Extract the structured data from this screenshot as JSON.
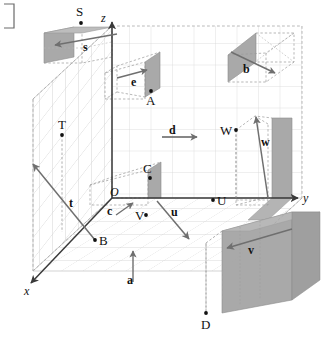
{
  "figure": {
    "corner_mark": "]",
    "colors": {
      "background": "#ffffff",
      "grid_line": "#d2d2d2",
      "grid_line_strong": "#bdbdbd",
      "shade_fill": "#a9a9a9",
      "shade_fill_light": "#bfbfbf",
      "axis": "#3a3a3a",
      "vector": "#787878",
      "dashed": "#9a9a9a",
      "label": "#111111"
    },
    "axes": [
      {
        "name": "x-axis",
        "label": "x",
        "x": 24,
        "y": 291,
        "direction": "down-left"
      },
      {
        "name": "y-axis",
        "label": "y",
        "x": 303,
        "y": 198,
        "direction": "right"
      },
      {
        "name": "z-axis",
        "label": "z",
        "x": 104,
        "y": 18,
        "direction": "up"
      }
    ],
    "origin": {
      "label": "O",
      "x": 110,
      "y": 192
    },
    "points": [
      {
        "label": "S",
        "lx": 76,
        "ly": 11,
        "px": 81,
        "py": 23
      },
      {
        "label": "A",
        "lx": 146,
        "ly": 100,
        "px": 151,
        "py": 91
      },
      {
        "label": "T",
        "lx": 60,
        "ly": 123,
        "px": 62,
        "py": 135
      },
      {
        "label": "C",
        "lx": 144,
        "ly": 167,
        "px": 150,
        "py": 178
      },
      {
        "label": "B",
        "lx": 100,
        "ly": 241,
        "px": 95,
        "py": 240
      },
      {
        "label": "V",
        "lx": 137,
        "ly": 215,
        "px": 146,
        "py": 215
      },
      {
        "label": "U",
        "lx": 219,
        "ly": 200,
        "px": 213,
        "py": 200
      },
      {
        "label": "W",
        "lx": 222,
        "ly": 129,
        "px": 236,
        "py": 130
      },
      {
        "label": "D",
        "lx": 203,
        "ly": 324,
        "px": 206,
        "py": 313
      }
    ],
    "vectors": [
      {
        "name": "s",
        "label": "s",
        "lx": 85,
        "ly": 46,
        "x1": 117,
        "y1": 34,
        "x2": 53,
        "y2": 45
      },
      {
        "name": "b",
        "label": "b",
        "lx": 245,
        "ly": 69,
        "x1": 235,
        "y1": 52,
        "x2": 277,
        "y2": 73
      },
      {
        "name": "e",
        "label": "e",
        "lx": 133,
        "ly": 82,
        "x1": 117,
        "y1": 77,
        "x2": 148,
        "y2": 70
      },
      {
        "name": "d",
        "label": "d",
        "lx": 171,
        "ly": 130,
        "x1": 162,
        "y1": 136,
        "x2": 198,
        "y2": 136
      },
      {
        "name": "w",
        "label": "w",
        "lx": 263,
        "ly": 142,
        "x1": 268,
        "y1": 197,
        "x2": 255,
        "y2": 116
      },
      {
        "name": "t",
        "label": "t",
        "lx": 71,
        "ly": 203,
        "x1": 95,
        "y1": 240,
        "x2": 31,
        "y2": 163
      },
      {
        "name": "c",
        "label": "c",
        "lx": 110,
        "ly": 211,
        "x1": 117,
        "y1": 214,
        "x2": 133,
        "y2": 203
      },
      {
        "name": "u",
        "label": "u",
        "lx": 173,
        "ly": 212,
        "x1": 157,
        "y1": 201,
        "x2": 190,
        "y2": 240
      },
      {
        "name": "v",
        "label": "v",
        "lx": 250,
        "ly": 250,
        "x1": 291,
        "y1": 229,
        "x2": 226,
        "y2": 248
      },
      {
        "name": "a",
        "label": "a",
        "lx": 129,
        "ly": 280,
        "x1": 133,
        "y1": 281,
        "x2": 133,
        "y2": 250
      }
    ],
    "shaded_planes": [
      {
        "name": "plane-s",
        "desc": "shaded strip near S"
      },
      {
        "name": "plane-b",
        "desc": "shaded parallelogram near b"
      },
      {
        "name": "plane-e-A",
        "desc": "shaded rectangle containing A"
      },
      {
        "name": "plane-C",
        "desc": "shaded rectangle containing C"
      },
      {
        "name": "plane-u",
        "desc": "shaded rectangle near U"
      },
      {
        "name": "plane-w",
        "desc": "shaded wall near w"
      },
      {
        "name": "plane-v-D",
        "desc": "large shaded plane near D and v"
      }
    ]
  }
}
